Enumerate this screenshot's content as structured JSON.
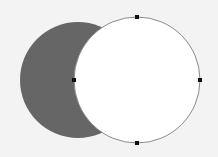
{
  "canvas": {
    "width": 218,
    "height": 157,
    "background": "#f3f3f3"
  },
  "shapes": {
    "crescent": {
      "name": "crescent-shape",
      "fill": "#666666",
      "outer_circle": {
        "cx": 78,
        "cy": 80,
        "r": 58
      },
      "cut_circle": {
        "cx": 137,
        "cy": 80,
        "r": 63
      }
    },
    "selected_circle": {
      "name": "selected-circle-outline",
      "cx": 137,
      "cy": 80,
      "r": 63,
      "stroke": "#8a8a8a",
      "interior_fill": "#ffffff"
    }
  },
  "anchor_handles": [
    {
      "name": "anchor-top",
      "x": 137,
      "y": 17
    },
    {
      "name": "anchor-right",
      "x": 200,
      "y": 80
    },
    {
      "name": "anchor-bottom",
      "x": 137,
      "y": 143
    },
    {
      "name": "anchor-left",
      "x": 74,
      "y": 80
    }
  ],
  "handle_color": "#111111",
  "handle_size": 4
}
